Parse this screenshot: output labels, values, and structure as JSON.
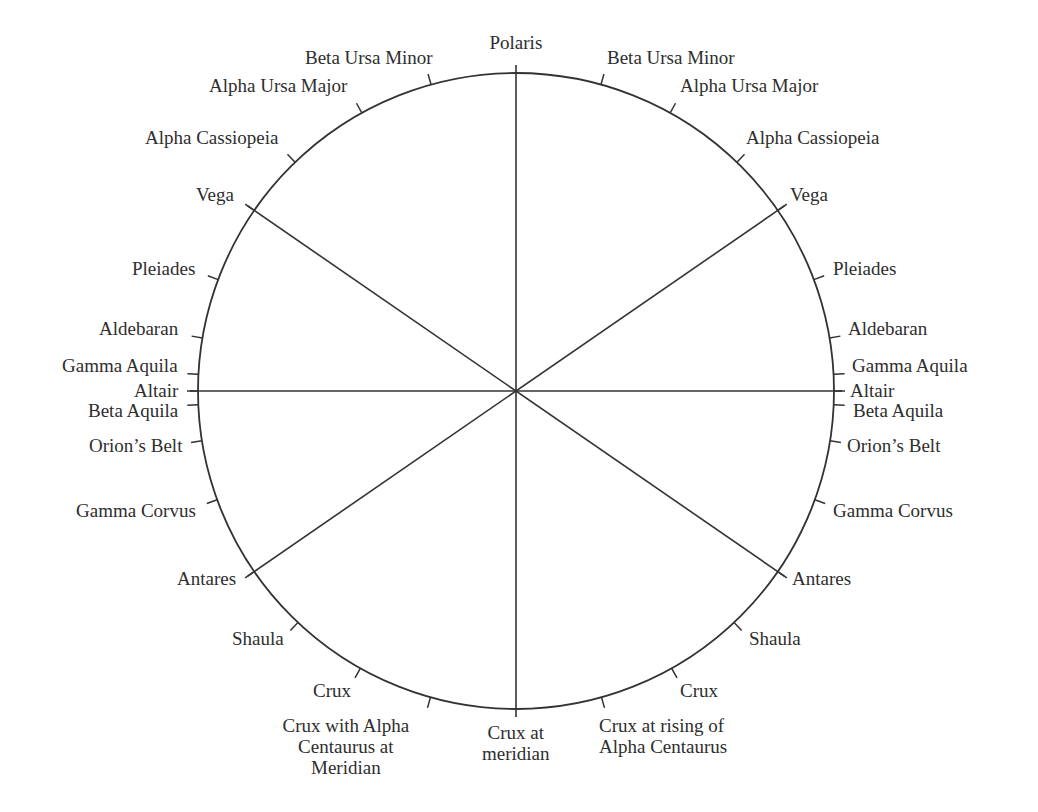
{
  "diagram": {
    "type": "star-compass",
    "stroke_color": "#333333",
    "text_color": "#2e2e2e",
    "center": [
      516,
      391
    ],
    "radius": 318,
    "axes": [
      {
        "name": "meridian",
        "angle_deg": 0
      },
      {
        "name": "horizon",
        "angle_deg": 90
      },
      {
        "name": "vega-antares-right",
        "angle_deg": 55.4
      },
      {
        "name": "vega-antares-left",
        "angle_deg": -55.4
      }
    ],
    "top_label": {
      "text": "Polaris",
      "x": 516,
      "y": 32
    },
    "bottom_label": {
      "text": "Crux at\nmeridian",
      "x": 516,
      "y": 722
    },
    "right_side": [
      {
        "text": "Beta Ursa Minor",
        "angle_deg": 15.5,
        "x": 607,
        "y": 47,
        "align": "left"
      },
      {
        "text": "Alpha Ursa Major",
        "angle_deg": 29,
        "x": 680,
        "y": 75,
        "align": "left"
      },
      {
        "text": "Alpha Cassiopeia",
        "angle_deg": 44,
        "x": 746,
        "y": 127,
        "align": "left"
      },
      {
        "text": "Vega",
        "angle_deg": 55.4,
        "x": 790,
        "y": 184,
        "align": "left"
      },
      {
        "text": "Pleiades",
        "angle_deg": 69.5,
        "x": 833,
        "y": 258,
        "align": "left"
      },
      {
        "text": "Aldebaran",
        "angle_deg": 80.4,
        "x": 848,
        "y": 318,
        "align": "left"
      },
      {
        "text": "Gamma Aquila",
        "angle_deg": 87,
        "x": 852,
        "y": 355,
        "align": "left"
      },
      {
        "text": "Altair",
        "angle_deg": 90,
        "x": 850,
        "y": 380,
        "align": "left"
      },
      {
        "text": "Beta Aquila",
        "angle_deg": 92.5,
        "x": 853,
        "y": 400,
        "align": "left"
      },
      {
        "text": "Orion’s Belt",
        "angle_deg": 99,
        "x": 847,
        "y": 435,
        "align": "left"
      },
      {
        "text": "Gamma Corvus",
        "angle_deg": 110,
        "x": 833,
        "y": 500,
        "align": "left"
      },
      {
        "text": "Antares",
        "angle_deg": 124.6,
        "x": 792,
        "y": 568,
        "align": "left"
      },
      {
        "text": "Shaula",
        "angle_deg": 136.7,
        "x": 749,
        "y": 628,
        "align": "left"
      },
      {
        "text": "Crux",
        "angle_deg": 150.7,
        "x": 680,
        "y": 680,
        "align": "left"
      },
      {
        "text": "Crux at rising of\nAlpha Centaurus",
        "angle_deg": 164.4,
        "x": 599,
        "y": 715,
        "align": "left"
      }
    ],
    "left_side": [
      {
        "text": "Beta Ursa Minor",
        "angle_deg": -15.5,
        "x": 433,
        "y": 47,
        "align": "right"
      },
      {
        "text": "Alpha Ursa Major",
        "angle_deg": -29,
        "x": 347,
        "y": 75,
        "align": "right"
      },
      {
        "text": "Alpha Cassiopeia",
        "angle_deg": -44,
        "x": 279,
        "y": 127,
        "align": "right"
      },
      {
        "text": "Vega",
        "angle_deg": -55.4,
        "x": 234,
        "y": 184,
        "align": "right"
      },
      {
        "text": "Pleiades",
        "angle_deg": -69.5,
        "x": 195,
        "y": 258,
        "align": "right"
      },
      {
        "text": "Aldebaran",
        "angle_deg": -80.4,
        "x": 178,
        "y": 318,
        "align": "right"
      },
      {
        "text": "Gamma Aquila",
        "angle_deg": -87,
        "x": 178,
        "y": 355,
        "align": "right"
      },
      {
        "text": "Altair",
        "angle_deg": -90,
        "x": 178,
        "y": 380,
        "align": "right"
      },
      {
        "text": "Beta Aquila",
        "angle_deg": -92.5,
        "x": 178,
        "y": 400,
        "align": "right"
      },
      {
        "text": "Orion’s Belt",
        "angle_deg": -99,
        "x": 182,
        "y": 435,
        "align": "right"
      },
      {
        "text": "Gamma Corvus",
        "angle_deg": -110,
        "x": 196,
        "y": 500,
        "align": "right"
      },
      {
        "text": "Antares",
        "angle_deg": -124.6,
        "x": 236,
        "y": 568,
        "align": "right"
      },
      {
        "text": "Shaula",
        "angle_deg": -136.7,
        "x": 284,
        "y": 628,
        "align": "right"
      },
      {
        "text": "Crux",
        "angle_deg": -150.7,
        "x": 351,
        "y": 680,
        "align": "right"
      },
      {
        "text": "Crux with Alpha\nCentaurus at\nMeridian",
        "angle_deg": -164.4,
        "x": 346,
        "y": 715,
        "align": "center"
      }
    ]
  }
}
